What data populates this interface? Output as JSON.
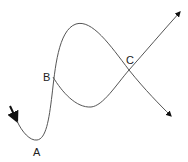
{
  "diagram": {
    "type": "curve-path-diagram",
    "stroke_color": "#555555",
    "arrow_color": "#111111",
    "labels": {
      "a": "A",
      "b": "B",
      "c": "C"
    },
    "points": [
      {
        "label": "A",
        "description": "local minimum of curve"
      },
      {
        "label": "B",
        "description": "branch point where curve splits"
      },
      {
        "label": "C",
        "description": "crossing point of two branches"
      }
    ],
    "arrows": [
      {
        "name": "entry-arrow",
        "direction": "down-right"
      },
      {
        "name": "exit-arrow-lower",
        "direction": "down-right"
      },
      {
        "name": "exit-arrow-upper",
        "direction": "up-right"
      }
    ]
  }
}
